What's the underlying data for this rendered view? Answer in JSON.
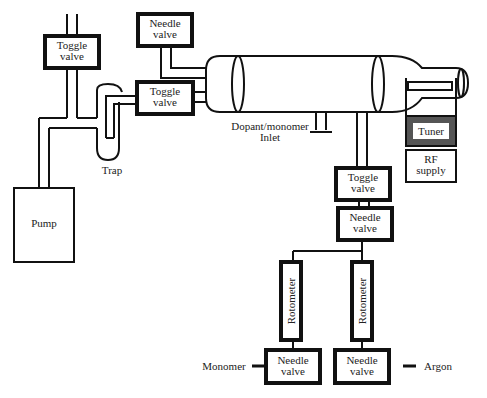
{
  "diagram": {
    "type": "plasma polymerization apparatus schematic",
    "components": {
      "toggle_valve_top": "Toggle\nvalve",
      "needle_valve_top": "Needle\nvalve",
      "toggle_valve_trap": "Toggle\nvalve",
      "trap": "Trap",
      "pump": "Pump",
      "inlet": "Dopant/monomer\nInlet",
      "tuner": "Tuner",
      "rf_supply": "RF\nsupply",
      "toggle_valve_bottom": "Toggle\nvalve",
      "needle_valve_mid": "Needle\nvalve",
      "rotometer_left": "Rotometer",
      "rotometer_right": "Rotometer",
      "needle_valve_left": "Needle\nvalve",
      "needle_valve_right": "Needle\nvalve",
      "monomer": "Monomer",
      "argon": "Argon"
    },
    "colors": {
      "line": "#111111",
      "box_border": "#222222",
      "tuner_fill": "#555555",
      "background": "#ffffff"
    }
  }
}
